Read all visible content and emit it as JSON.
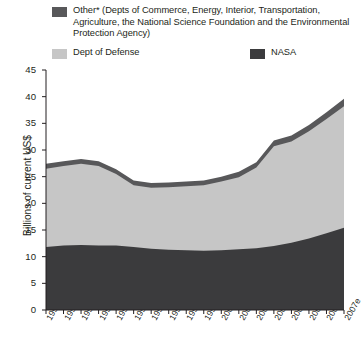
{
  "legend": {
    "entries": [
      {
        "name": "other",
        "label": "Other* (Depts of Commerce, Energy, Interior, Transportation, Agriculture, the National Science Foundation and the Environmental Protection Agency)",
        "color": "#58585a"
      },
      {
        "name": "dept-of-defense",
        "label": "Dept of Defense",
        "color": "#c6c6c6"
      },
      {
        "name": "nasa",
        "label": "NASA",
        "color": "#3b3b3d"
      }
    ]
  },
  "chart_data": {
    "type": "area",
    "title": "",
    "xlabel": "",
    "ylabel": "Billions of current US$",
    "stacked": true,
    "grid": false,
    "legend_position": "top",
    "ylim": [
      0,
      45
    ],
    "yticks": [
      0,
      5,
      10,
      15,
      20,
      25,
      30,
      35,
      40,
      45
    ],
    "categories": [
      "1990",
      "1991",
      "1992",
      "1993",
      "1994",
      "1995",
      "1996",
      "1997",
      "1998",
      "1999",
      "2000",
      "2001",
      "2002",
      "2003",
      "2004",
      "2005",
      "2006e",
      "2007e"
    ],
    "series": [
      {
        "name": "NASA",
        "color": "#3b3b3d",
        "values": [
          11.8,
          12.1,
          12.2,
          12.1,
          12.1,
          11.8,
          11.5,
          11.3,
          11.2,
          11.1,
          11.2,
          11.4,
          11.6,
          12.0,
          12.6,
          13.4,
          14.4,
          15.4
        ]
      },
      {
        "name": "Dept of Defense",
        "color": "#c6c6c6",
        "values": [
          14.7,
          14.9,
          15.2,
          14.9,
          13.4,
          11.6,
          11.4,
          11.7,
          12.0,
          12.3,
          12.9,
          13.5,
          15.1,
          18.7,
          19.0,
          20.1,
          21.4,
          22.8
        ]
      },
      {
        "name": "Other*",
        "color": "#58585a",
        "values": [
          0.9,
          0.9,
          0.9,
          0.9,
          0.9,
          0.9,
          0.9,
          0.9,
          0.9,
          0.9,
          0.9,
          1.0,
          1.0,
          1.1,
          1.1,
          1.2,
          1.3,
          1.4
        ]
      }
    ],
    "totals": [
      27.4,
      27.9,
      28.3,
      27.9,
      26.4,
      24.3,
      23.8,
      23.9,
      24.1,
      24.3,
      25.0,
      25.9,
      27.7,
      31.8,
      32.7,
      34.7,
      37.1,
      39.6
    ]
  }
}
